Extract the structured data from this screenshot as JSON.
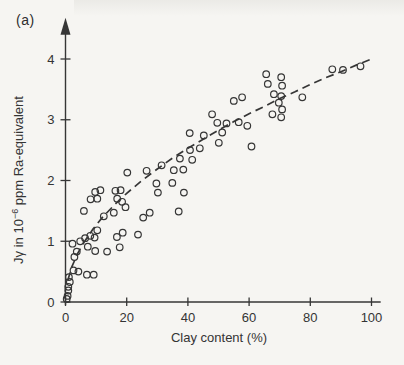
{
  "page": {
    "background": "#f6f5f2",
    "ink": "#363636"
  },
  "figure_label": "(a)",
  "chart_data": {
    "type": "scatter",
    "title": "",
    "xlabel": "Clay content (%)",
    "ylabel": {
      "prefix": "Jγ in 10",
      "superscript": "−6",
      "suffix": " ppm Ra-equivalent",
      "plain": "Jγ in 10^−6 ppm Ra-equivalent"
    },
    "x_ticks": [
      0,
      20,
      40,
      60,
      80,
      100
    ],
    "y_ticks": [
      0,
      1,
      2,
      3,
      4
    ],
    "xlim": [
      0,
      103
    ],
    "ylim": [
      0,
      4.35
    ],
    "grid": false,
    "y_axis_arrow": true,
    "legend": "none",
    "marker": {
      "shape": "open-circle",
      "radius_px": 3.3
    },
    "trend": {
      "style": "dashed",
      "formula": "y ≈ 0.4·√x",
      "points": [
        [
          0.8,
          0.36
        ],
        [
          2,
          0.57
        ],
        [
          4,
          0.8
        ],
        [
          6,
          0.98
        ],
        [
          9,
          1.2
        ],
        [
          12,
          1.39
        ],
        [
          16,
          1.6
        ],
        [
          20,
          1.79
        ],
        [
          25,
          2.0
        ],
        [
          30,
          2.19
        ],
        [
          35,
          2.37
        ],
        [
          40,
          2.53
        ],
        [
          45,
          2.68
        ],
        [
          50,
          2.83
        ],
        [
          55,
          2.97
        ],
        [
          60,
          3.1
        ],
        [
          65,
          3.22
        ],
        [
          70,
          3.35
        ],
        [
          75,
          3.46
        ],
        [
          80,
          3.58
        ],
        [
          85,
          3.69
        ],
        [
          90,
          3.79
        ],
        [
          95,
          3.9
        ],
        [
          100,
          4.0
        ]
      ]
    },
    "points": [
      [
        0.4,
        0.05
      ],
      [
        0.7,
        0.1
      ],
      [
        0.9,
        0.19
      ],
      [
        0.9,
        0.25
      ],
      [
        1.4,
        0.33
      ],
      [
        1.1,
        0.41
      ],
      [
        2.6,
        0.52
      ],
      [
        4.2,
        0.5
      ],
      [
        7.0,
        0.45
      ],
      [
        9.2,
        0.45
      ],
      [
        2.9,
        0.74
      ],
      [
        3.7,
        0.83
      ],
      [
        9.7,
        0.84
      ],
      [
        2.3,
        0.96
      ],
      [
        4.8,
        1.0
      ],
      [
        6.4,
        1.05
      ],
      [
        8.1,
        1.09
      ],
      [
        9.5,
        1.06
      ],
      [
        7.3,
        0.91
      ],
      [
        10.4,
        1.18
      ],
      [
        16.8,
        1.07
      ],
      [
        17.7,
        0.9
      ],
      [
        18.7,
        1.14
      ],
      [
        23.7,
        1.11
      ],
      [
        13.6,
        0.83
      ],
      [
        6.0,
        1.5
      ],
      [
        8.2,
        1.69
      ],
      [
        9.7,
        1.81
      ],
      [
        10.4,
        1.7
      ],
      [
        11.4,
        1.84
      ],
      [
        12.5,
        1.41
      ],
      [
        15.8,
        1.47
      ],
      [
        16.3,
        1.83
      ],
      [
        16.9,
        1.7
      ],
      [
        18.0,
        1.84
      ],
      [
        18.5,
        1.65
      ],
      [
        19.6,
        1.56
      ],
      [
        20.2,
        2.13
      ],
      [
        26.5,
        2.16
      ],
      [
        31.4,
        2.25
      ],
      [
        25.4,
        1.39
      ],
      [
        27.5,
        1.47
      ],
      [
        29.7,
        1.95
      ],
      [
        30.2,
        1.8
      ],
      [
        34.9,
        1.96
      ],
      [
        35.4,
        2.17
      ],
      [
        37.4,
        2.36
      ],
      [
        38.5,
        2.18
      ],
      [
        38.7,
        1.8
      ],
      [
        37.0,
        1.49
      ],
      [
        40.7,
        2.5
      ],
      [
        41.4,
        2.34
      ],
      [
        43.9,
        2.53
      ],
      [
        40.6,
        2.78
      ],
      [
        45.2,
        2.74
      ],
      [
        47.9,
        3.09
      ],
      [
        49.6,
        2.95
      ],
      [
        51.2,
        2.79
      ],
      [
        52.6,
        2.94
      ],
      [
        55.0,
        3.31
      ],
      [
        56.6,
        2.96
      ],
      [
        57.7,
        3.37
      ],
      [
        59.4,
        2.9
      ],
      [
        50.1,
        2.62
      ],
      [
        60.8,
        2.56
      ],
      [
        65.6,
        3.75
      ],
      [
        66.1,
        3.59
      ],
      [
        70.5,
        3.7
      ],
      [
        70.8,
        3.56
      ],
      [
        68.1,
        3.42
      ],
      [
        70.5,
        3.39
      ],
      [
        69.7,
        3.28
      ],
      [
        70.8,
        3.17
      ],
      [
        67.6,
        3.09
      ],
      [
        70.5,
        3.04
      ],
      [
        77.4,
        3.37
      ],
      [
        87.2,
        3.83
      ],
      [
        90.7,
        3.82
      ],
      [
        96.4,
        3.88
      ]
    ]
  }
}
